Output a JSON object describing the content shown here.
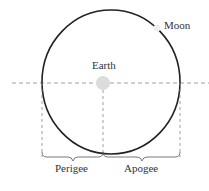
{
  "diagram": {
    "labels": {
      "moon": "Moon",
      "earth": "Earth",
      "perigee": "Perigee",
      "apogee": "Apogee"
    },
    "colors": {
      "orbit": "#222222",
      "dashed": "#888888",
      "earth": "#dddddd",
      "moon": "#eeeeee",
      "text": "#333333"
    }
  }
}
